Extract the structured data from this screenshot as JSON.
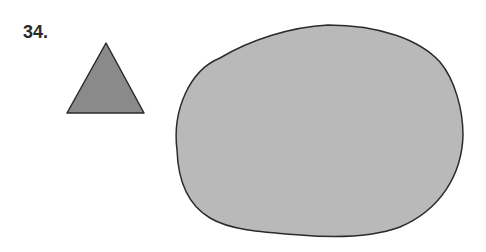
{
  "problem": {
    "number_label": "34."
  },
  "shapes": {
    "triangle": {
      "points": "106,43 67,113 144,113",
      "fill": "#8a8a8a",
      "stroke": "#2b2b2b",
      "stroke_width": "1.5"
    },
    "blob": {
      "path": "M 177 150 C 172 110, 190 70, 220 58 C 250 40, 290 27, 328 25 C 380 25, 420 40, 440 62 C 455 80, 463 110, 463 135 C 462 175, 440 210, 400 227 C 370 238, 335 238, 300 235 C 260 232, 230 230, 210 218 C 188 205, 178 180, 177 150 Z",
      "fill": "#b9b9b9",
      "stroke": "#2b2b2b",
      "stroke_width": "1.5"
    }
  }
}
